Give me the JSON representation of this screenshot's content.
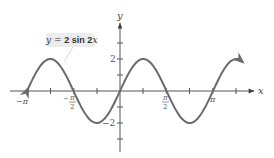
{
  "chart_data": {
    "type": "line",
    "title": "",
    "equation_label": "y = 2 sin 2x",
    "xlabel": "x",
    "ylabel": "y",
    "function": "y = 2*sin(2*x)",
    "domain": [
      -3.1,
      4.15
    ],
    "amplitude": 2,
    "period": 3.14159,
    "x_tick_step": "pi/4",
    "x_tick_labels": [
      "-π",
      "-π/2",
      "π/2",
      "π"
    ],
    "x_tick_label_values": [
      -3.14159,
      -1.5708,
      1.5708,
      3.14159
    ],
    "y_ticks": [
      -3,
      -2,
      -1,
      1,
      2,
      3
    ],
    "y_tick_labels": [
      "2",
      "-2"
    ],
    "y_tick_label_values": [
      2,
      -2
    ],
    "xlim": [
      -3.9,
      4.5
    ],
    "ylim": [
      -3.3,
      4.2
    ],
    "grid": false,
    "legend": "none",
    "curve_color": "#6b6b6b",
    "axis_color": "#555555",
    "label_box_color": "#ececec",
    "x": [
      -3.1416,
      -2.3562,
      -1.5708,
      -0.7854,
      0,
      0.7854,
      1.5708,
      2.3562,
      3.1416,
      3.927
    ],
    "values": [
      0,
      2,
      0,
      -2,
      0,
      2,
      0,
      -2,
      0,
      2
    ]
  },
  "labels": {
    "y_axis": "y",
    "x_axis": "x",
    "neg_pi": "−π",
    "neg_pi_half_num": "π",
    "neg_pi_half_den": "2",
    "pi_half_num": "π",
    "pi_half_den": "2",
    "pi": "π",
    "two": "2",
    "neg_two": "−2",
    "eq_y": "y",
    "eq_eq": " = ",
    "eq_2": "2 sin 2",
    "eq_x": "x"
  }
}
